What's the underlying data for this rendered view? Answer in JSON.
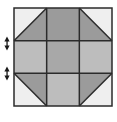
{
  "figure": {
    "name": "quilt-block-diagram",
    "width": 117,
    "height": 122,
    "background_color": "#FFFFFF"
  },
  "palette": {
    "light": "#EFEFEF",
    "medium_light": "#BDBDBD",
    "medium": "#A8A8A8",
    "medium_dark": "#9B9B9B",
    "outline": "#2B2B2B",
    "grid_line": "#2B2B2B",
    "marker": "#1A1A1A"
  },
  "block": {
    "name": "nine-patch-octagon",
    "x": 14,
    "y": 8,
    "size": 98,
    "rows": 3,
    "cols": 3,
    "outline_width": 1.5,
    "grid_line_width": 1.5,
    "cells": [
      {
        "id": "cell-top-left",
        "row": 0,
        "col": 0,
        "type": "half-square-triangle",
        "diagonal": "tl-br",
        "fill_upper_left": "#EFEFEF",
        "fill_lower_right": "#9B9B9B"
      },
      {
        "id": "cell-top-center",
        "row": 0,
        "col": 1,
        "type": "solid",
        "fill": "#9B9B9B"
      },
      {
        "id": "cell-top-right",
        "row": 0,
        "col": 2,
        "type": "half-square-triangle",
        "diagonal": "tr-bl",
        "fill_upper_right": "#EFEFEF",
        "fill_lower_left": "#9B9B9B"
      },
      {
        "id": "cell-middle-left",
        "row": 1,
        "col": 0,
        "type": "solid",
        "fill": "#BDBDBD"
      },
      {
        "id": "cell-center",
        "row": 1,
        "col": 1,
        "type": "solid",
        "fill": "#A8A8A8"
      },
      {
        "id": "cell-middle-right",
        "row": 1,
        "col": 2,
        "type": "solid",
        "fill": "#BDBDBD"
      },
      {
        "id": "cell-bottom-left",
        "row": 2,
        "col": 0,
        "type": "half-square-triangle",
        "diagonal": "tr-bl",
        "fill_upper_right": "#9B9B9B",
        "fill_lower_left": "#EFEFEF"
      },
      {
        "id": "cell-bottom-center",
        "row": 2,
        "col": 1,
        "type": "solid",
        "fill": "#BDBDBD"
      },
      {
        "id": "cell-bottom-right",
        "row": 2,
        "col": 2,
        "type": "half-square-triangle",
        "diagonal": "tl-br",
        "fill_upper_left": "#9B9B9B",
        "fill_lower_right": "#EFEFEF"
      }
    ]
  },
  "markers": [
    {
      "id": "marker-upper",
      "name": "seam-direction-marker-upper",
      "glyph": "arrow-pair",
      "x": 7,
      "y": 43,
      "color": "#1A1A1A"
    },
    {
      "id": "marker-lower",
      "name": "seam-direction-marker-lower",
      "glyph": "arrow-pair",
      "x": 7,
      "y": 73,
      "color": "#1A1A1A"
    }
  ]
}
